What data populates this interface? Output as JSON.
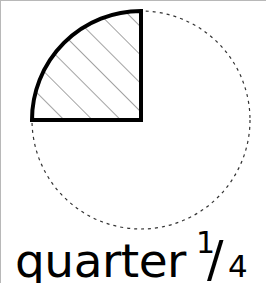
{
  "canvas": {
    "width": 266,
    "height": 283,
    "background_color": "#ffffff",
    "border_color": "#b8b8b8"
  },
  "caption": {
    "word": "quarter",
    "fraction_numerator": "1",
    "fraction_slash": "/",
    "fraction_denominator": "4",
    "full_text": "quarter 1/4",
    "text_color": "#000000"
  },
  "figure": {
    "circle": {
      "center_x": 140,
      "center_y": 119,
      "radius": 109,
      "stroke_style": "dashed",
      "stroke_color": "#333333",
      "stroke_width": 1.2,
      "dash_pattern": "3 4",
      "fill": "none"
    },
    "quarter_sector": {
      "label": "quarter",
      "fraction": "1/4",
      "start_angle_deg": 180,
      "end_angle_deg": 270,
      "quadrant": "upper-left",
      "stroke_color": "#000000",
      "stroke_width": 4,
      "fill": "none",
      "hatch": {
        "angle_deg": 45,
        "spacing": 20,
        "stroke_color": "#555555",
        "stroke_width": 1.1
      }
    }
  }
}
